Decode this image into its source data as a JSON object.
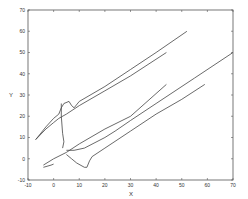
{
  "chart_data": {
    "type": "line",
    "title": "",
    "xlabel": "X",
    "ylabel": "Y",
    "xlim": [
      -10,
      70
    ],
    "ylim": [
      -10,
      70
    ],
    "grid": false,
    "legend": null,
    "x_ticks": [
      -10,
      0,
      10,
      20,
      30,
      40,
      50,
      60,
      70
    ],
    "y_ticks": [
      -10,
      0,
      10,
      20,
      30,
      40,
      50,
      60,
      70
    ],
    "line_color": "#444444",
    "series": [
      {
        "name": "curve-1",
        "points": [
          [
            -7,
            9
          ],
          [
            -3,
            14
          ],
          [
            0,
            17
          ],
          [
            2,
            19
          ],
          [
            5,
            21
          ],
          [
            10,
            25
          ],
          [
            20,
            32
          ],
          [
            30,
            39
          ],
          [
            44,
            50
          ]
        ]
      },
      {
        "name": "curve-2",
        "points": [
          [
            -7,
            9
          ],
          [
            -3,
            15
          ],
          [
            0,
            19
          ],
          [
            2,
            21
          ],
          [
            3,
            24
          ],
          [
            4,
            26
          ],
          [
            6,
            27
          ],
          [
            7,
            25
          ],
          [
            8,
            24
          ],
          [
            10,
            27
          ],
          [
            20,
            34
          ],
          [
            30,
            42
          ],
          [
            40,
            50
          ],
          [
            52,
            60
          ]
        ]
      },
      {
        "name": "curve-3",
        "points": [
          [
            3,
            26
          ],
          [
            3,
            20
          ],
          [
            3.5,
            12
          ],
          [
            4,
            8
          ],
          [
            3.5,
            5
          ]
        ]
      },
      {
        "name": "curve-4",
        "points": [
          [
            -4,
            -3
          ],
          [
            0,
            0
          ],
          [
            5,
            3
          ],
          [
            10,
            7
          ],
          [
            20,
            14
          ],
          [
            30,
            20
          ],
          [
            44,
            35
          ]
        ]
      },
      {
        "name": "curve-5",
        "points": [
          [
            -4,
            -4
          ],
          [
            -1,
            -3
          ],
          [
            0,
            -2.5
          ]
        ]
      },
      {
        "name": "curve-6",
        "points": [
          [
            5,
            4
          ],
          [
            8,
            4
          ],
          [
            12,
            5
          ],
          [
            20,
            10
          ],
          [
            24,
            13
          ],
          [
            30,
            18
          ],
          [
            40,
            26
          ],
          [
            55,
            38
          ],
          [
            70,
            50
          ]
        ]
      },
      {
        "name": "curve-7",
        "points": [
          [
            5,
            2
          ],
          [
            7,
            0
          ],
          [
            9,
            -2
          ],
          [
            12,
            -4
          ],
          [
            13,
            -4
          ],
          [
            14,
            -1
          ],
          [
            15,
            1
          ],
          [
            20,
            5
          ],
          [
            30,
            13
          ],
          [
            40,
            21
          ],
          [
            50,
            28
          ],
          [
            59,
            35
          ]
        ]
      }
    ]
  }
}
